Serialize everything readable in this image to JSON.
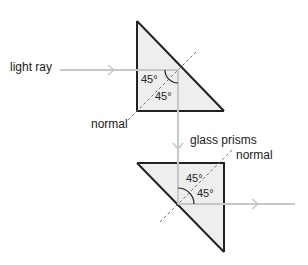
{
  "labels": {
    "light_ray": "light ray",
    "normal_1": "normal",
    "glass_prisms": "glass prisms",
    "normal_2": "normal"
  },
  "angles": {
    "prism1_incidence": "45°",
    "prism1_reflection": "45°",
    "prism2_incidence": "45°",
    "prism2_reflection": "45°"
  },
  "colors": {
    "prism_fill": "#eeeeee",
    "prism_edge": "#222222",
    "ray": "#c8c8c8",
    "normal": "#666666"
  }
}
